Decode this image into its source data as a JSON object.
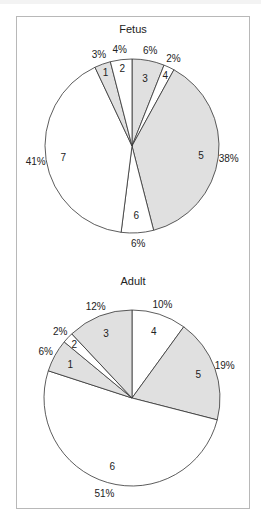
{
  "colors": {
    "gray": "#e0e0e0",
    "white": "#ffffff",
    "stroke": "#333333"
  },
  "chart_data": [
    {
      "type": "pie",
      "title": "Fetus",
      "start_angle": "12 o'clock, clockwise",
      "slices": [
        {
          "label": "3",
          "value": 6,
          "pct": "6%",
          "fill": "gray"
        },
        {
          "label": "4",
          "value": 2,
          "pct": "2%",
          "fill": "white"
        },
        {
          "label": "5",
          "value": 38,
          "pct": "38%",
          "fill": "gray"
        },
        {
          "label": "6",
          "value": 6,
          "pct": "6%",
          "fill": "white"
        },
        {
          "label": "7",
          "value": 41,
          "pct": "41%",
          "fill": "white"
        },
        {
          "label": "1",
          "value": 3,
          "pct": "3%",
          "fill": "gray"
        },
        {
          "label": "2",
          "value": 4,
          "pct": "4%",
          "fill": "white"
        }
      ]
    },
    {
      "type": "pie",
      "title": "Adult",
      "start_angle": "12 o'clock, clockwise",
      "slices": [
        {
          "label": "4",
          "value": 10,
          "pct": "10%",
          "fill": "white"
        },
        {
          "label": "5",
          "value": 19,
          "pct": "19%",
          "fill": "gray"
        },
        {
          "label": "6",
          "value": 51,
          "pct": "51%",
          "fill": "white"
        },
        {
          "label": "1",
          "value": 6,
          "pct": "6%",
          "fill": "gray"
        },
        {
          "label": "2",
          "value": 2,
          "pct": "2%",
          "fill": "white"
        },
        {
          "label": "3",
          "value": 12,
          "pct": "12%",
          "fill": "gray"
        }
      ]
    }
  ]
}
